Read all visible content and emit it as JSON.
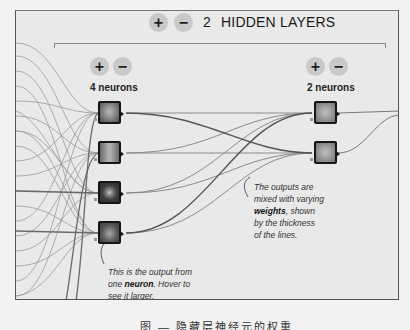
{
  "header": {
    "add_layer_label": "+",
    "remove_layer_label": "−",
    "layer_count": "2",
    "title": "HIDDEN LAYERS"
  },
  "layers": [
    {
      "add_neuron_label": "+",
      "remove_neuron_label": "−",
      "neuron_count_label": "4 neurons",
      "neurons": [
        {
          "pattern": "x-light-center"
        },
        {
          "pattern": "vertical-stripe"
        },
        {
          "pattern": "radial-dot"
        },
        {
          "pattern": "x-dark"
        }
      ]
    },
    {
      "add_neuron_label": "+",
      "remove_neuron_label": "−",
      "neuron_count_label": "2 neurons",
      "neurons": [
        {
          "pattern": "x-light"
        },
        {
          "pattern": "x-light"
        }
      ]
    }
  ],
  "annotations": {
    "neuron_note": {
      "prefix": "This is the output from one ",
      "bold": "neuron",
      "suffix": ". Hover to see it larger."
    },
    "weights_note": {
      "prefix": "The outputs are mixed with varying ",
      "bold": "weights",
      "suffix": ", shown by the thickness of the lines."
    }
  },
  "caption": "图 — 隐藏层神经元的权重",
  "colors": {
    "background": "#e9e9e9",
    "node_border": "#151515",
    "link": "#8a8a8a",
    "button": "#c9c9c9"
  }
}
